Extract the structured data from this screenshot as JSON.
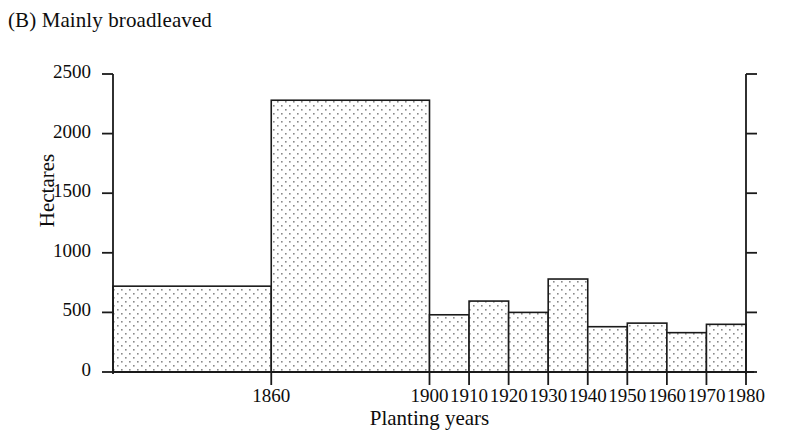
{
  "figure": {
    "title": "(B) Mainly broadleaved"
  },
  "chart_data": {
    "type": "bar",
    "title": "(B) Mainly broadleaved",
    "xlabel": "Planting years",
    "ylabel": "Hectares",
    "ylim": [
      0,
      2500
    ],
    "yticks": [
      0,
      500,
      1000,
      1500,
      2000,
      2500
    ],
    "ytick_labels": [
      "0",
      "500",
      "1000",
      "1500",
      "2000",
      "2500"
    ],
    "xticks": [
      1860,
      1900,
      1910,
      1920,
      1930,
      1940,
      1950,
      1960,
      1970,
      1980
    ],
    "xtick_labels": [
      "1860",
      "1900",
      "1910",
      "1920",
      "1930",
      "1940",
      "1950",
      "1960",
      "1970",
      "1980"
    ],
    "xlim": [
      1820,
      1980
    ],
    "grid": false,
    "legend": null,
    "bin_edges": [
      1820,
      1860,
      1900,
      1910,
      1920,
      1930,
      1940,
      1950,
      1960,
      1970,
      1980
    ],
    "categories": [
      "1820-1860",
      "1860-1900",
      "1900-1910",
      "1910-1920",
      "1920-1930",
      "1930-1940",
      "1940-1950",
      "1950-1960",
      "1960-1970",
      "1970-1980"
    ],
    "values": [
      720,
      2280,
      480,
      595,
      500,
      780,
      380,
      410,
      330,
      400
    ],
    "bar_fill": "stipple-dot",
    "bar_edge_color": "#1a1a1a",
    "bar_fill_color": "#ffffff",
    "bar_dot_color": "#8a8a8a",
    "axis_color": "#1a1a1a"
  },
  "colors": {
    "background": "#ffffff",
    "ink": "#111111",
    "stipple": "#8a8a8a"
  }
}
